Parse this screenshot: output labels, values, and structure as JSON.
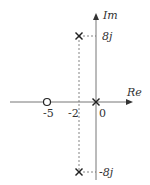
{
  "diagram": {
    "type": "pole-zero plot",
    "axes": {
      "x_label": "Re",
      "y_label": "Im",
      "origin_label": "0"
    },
    "tick_labels": {
      "zero_location": "-5",
      "pole_real_part": "-2",
      "origin": "0",
      "pole_upper_imag": "8j",
      "pole_lower_imag": "-8j"
    },
    "zeros": [
      {
        "re": -5,
        "im": 0
      }
    ],
    "poles": [
      {
        "re": 0,
        "im": 0
      },
      {
        "re": -2,
        "im": 8
      },
      {
        "re": -2,
        "im": -8
      }
    ],
    "colors": {
      "axis": "#666666",
      "marker": "#222222",
      "dashed": "#555555",
      "text": "#333333"
    }
  }
}
